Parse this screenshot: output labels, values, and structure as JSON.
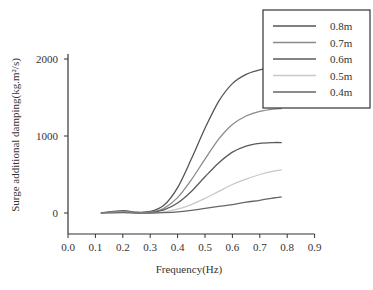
{
  "chart_data": {
    "type": "line",
    "title": "",
    "xlabel": "Frequency(Hz)",
    "ylabel": "Surge additional damping(kg.m²/s)",
    "xlim": [
      0.0,
      0.9
    ],
    "ylim": [
      -250,
      2000
    ],
    "xticks": [
      "0.0",
      "0.1",
      "0.2",
      "0.3",
      "0.4",
      "0.5",
      "0.6",
      "0.7",
      "0.8",
      "0.9"
    ],
    "yticks": [
      "0",
      "1000",
      "2000"
    ],
    "grid": false,
    "legend_position": "upper right",
    "x": [
      0.12,
      0.2,
      0.25,
      0.3,
      0.35,
      0.4,
      0.45,
      0.5,
      0.55,
      0.6,
      0.65,
      0.7,
      0.75,
      0.78
    ],
    "series": [
      {
        "name": "0.8m",
        "color": "#555555",
        "values": [
          0,
          30,
          10,
          20,
          100,
          330,
          700,
          1100,
          1450,
          1680,
          1800,
          1860,
          1880,
          1885
        ]
      },
      {
        "name": "0.7m",
        "color": "#8a8a8a",
        "values": [
          0,
          20,
          5,
          10,
          60,
          200,
          430,
          700,
          960,
          1150,
          1260,
          1320,
          1350,
          1355
        ]
      },
      {
        "name": "0.6m",
        "color": "#5a5a5a",
        "values": [
          0,
          15,
          0,
          5,
          40,
          130,
          280,
          470,
          650,
          790,
          870,
          905,
          915,
          915
        ]
      },
      {
        "name": "0.5m",
        "color": "#c8c8c8",
        "values": [
          0,
          10,
          0,
          0,
          15,
          50,
          110,
          190,
          280,
          370,
          440,
          500,
          545,
          560
        ]
      },
      {
        "name": "0.4m",
        "color": "#666666",
        "values": [
          0,
          5,
          0,
          0,
          5,
          15,
          35,
          60,
          85,
          110,
          140,
          165,
          195,
          210
        ]
      }
    ]
  }
}
